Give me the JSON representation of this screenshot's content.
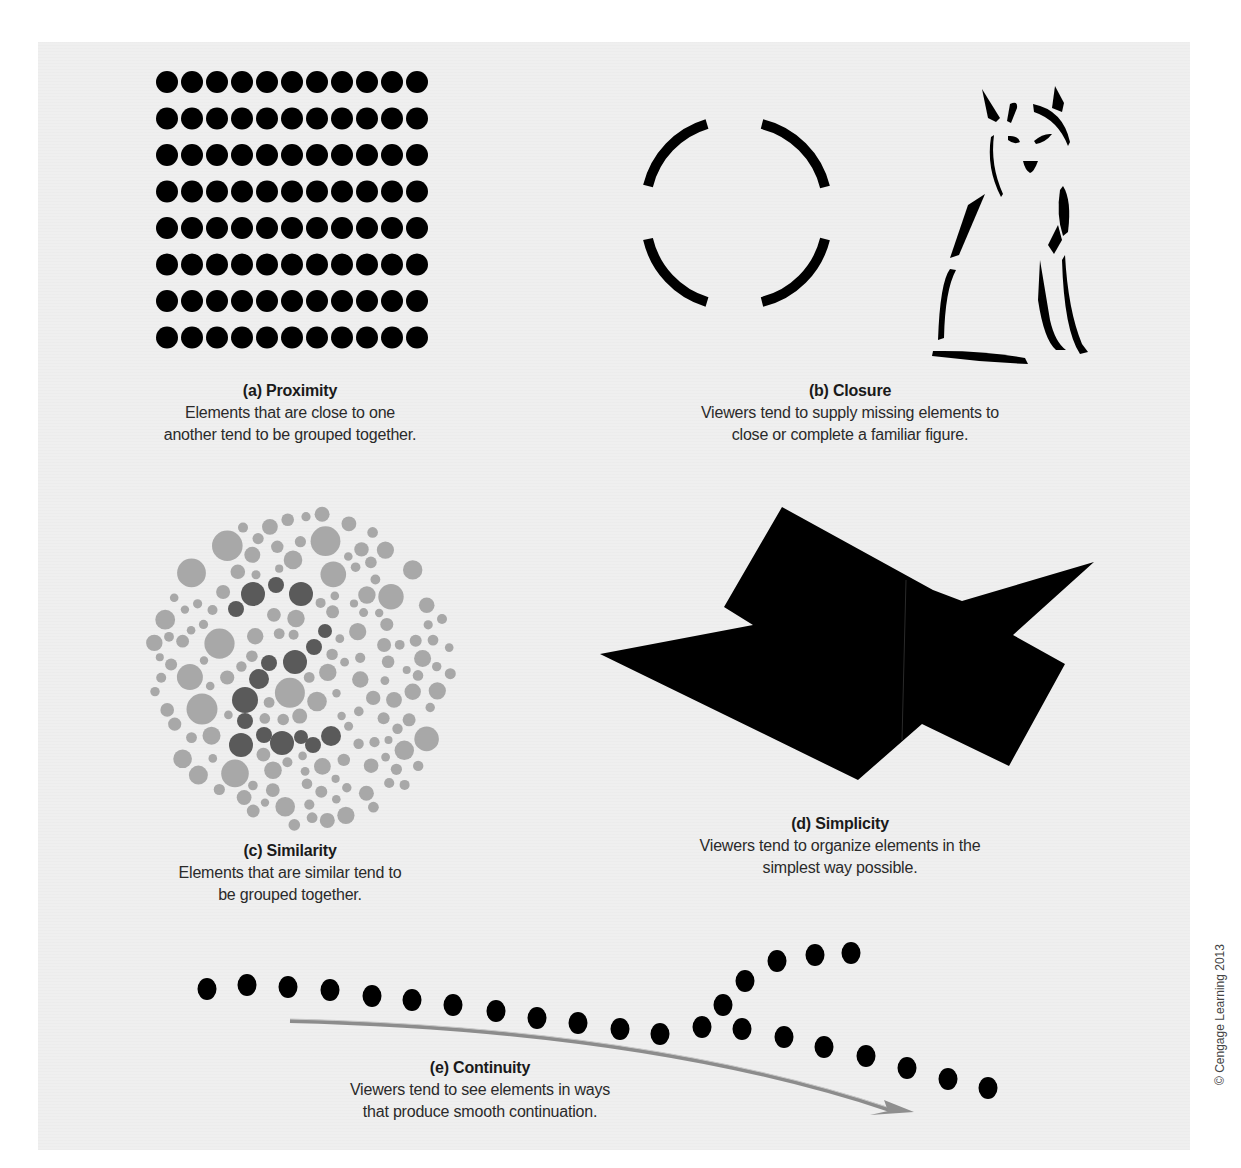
{
  "figure": {
    "panels": [
      {
        "id": "a",
        "title": "(a) Proximity",
        "description_lines": [
          "Elements that are close to one",
          "another tend to be grouped together."
        ],
        "illustration": {
          "type": "dot-grid",
          "rows": 8,
          "cols": 11,
          "color": "#000000"
        }
      },
      {
        "id": "b",
        "title": "(b) Closure",
        "description_lines": [
          "Viewers tend to supply missing elements to",
          "close or complete a familiar figure."
        ],
        "illustration": {
          "type": "broken-circle-and-fox-outline",
          "arc_segments": 4,
          "color": "#000000"
        }
      },
      {
        "id": "c",
        "title": "(c) Similarity",
        "description_lines": [
          "Elements that are similar tend to",
          "be grouped together."
        ],
        "illustration": {
          "type": "color-plate-dots",
          "light_color": "#a8a8a8",
          "dark_color": "#5a5a5a",
          "hidden_figure": "2"
        }
      },
      {
        "id": "d",
        "title": "(d) Simplicity",
        "description_lines": [
          "Viewers tend to organize elements in the",
          "simplest way possible."
        ],
        "illustration": {
          "type": "overlapping-polygons",
          "color": "#000000"
        }
      },
      {
        "id": "e",
        "title": "(e) Continuity",
        "description_lines": [
          "Viewers tend to see elements in ways",
          "that produce smooth continuation."
        ],
        "illustration": {
          "type": "dot-paths-with-arrow",
          "arrow_color": "#8a8a8a",
          "dot_color": "#000000"
        }
      }
    ],
    "credit": "© Cengage Learning 2013"
  }
}
